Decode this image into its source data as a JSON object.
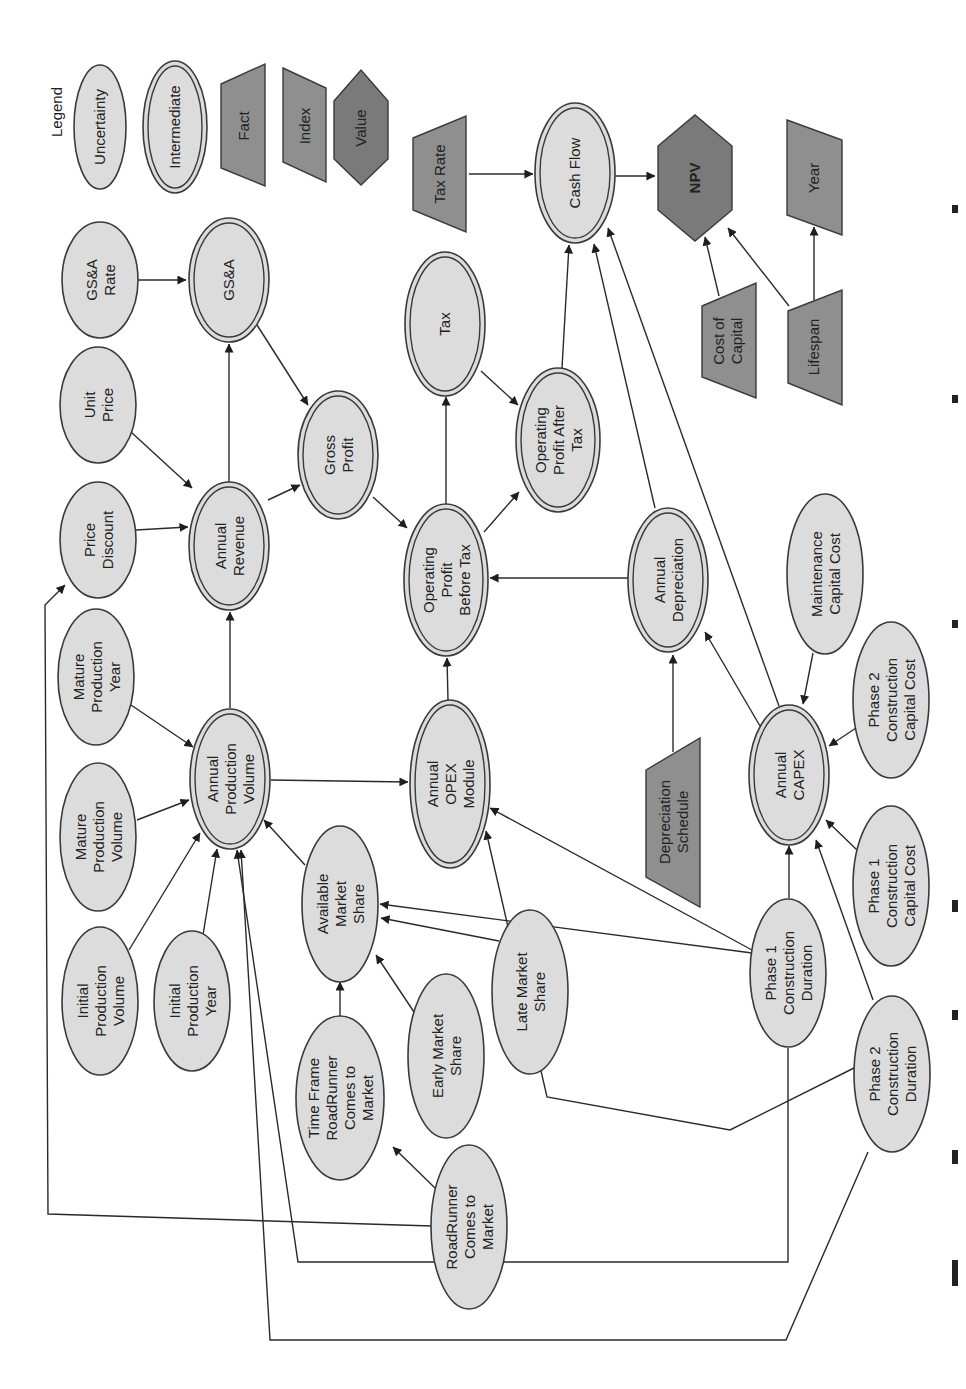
{
  "diagram": {
    "orientation": "rotated -90deg (landscape figure on portrait page)",
    "legend": {
      "title": "Legend",
      "items": [
        {
          "id": "lg-uncertainty",
          "label": "Uncertainty",
          "shape": "ellipse"
        },
        {
          "id": "lg-intermediate",
          "label": "Intermediate",
          "shape": "double-ellipse"
        },
        {
          "id": "lg-fact",
          "label": "Fact",
          "shape": "trapezoid"
        },
        {
          "id": "lg-index",
          "label": "Index",
          "shape": "parallelogram"
        },
        {
          "id": "lg-value",
          "label": "Value",
          "shape": "hexagon"
        }
      ]
    },
    "nodes": [
      {
        "id": "gsa_rate",
        "label": "GS&A\nRate",
        "type": "uncertainty",
        "cx": 100,
        "cy": 280,
        "rx": 38,
        "ry": 58
      },
      {
        "id": "gsa",
        "label": "GS&A",
        "type": "intermediate",
        "cx": 229,
        "cy": 280,
        "rx": 40,
        "ry": 62
      },
      {
        "id": "unit_price",
        "label": "Unit\nPrice",
        "type": "uncertainty",
        "cx": 98,
        "cy": 405,
        "rx": 38,
        "ry": 58
      },
      {
        "id": "price_discount",
        "label": "Price\nDiscount",
        "type": "uncertainty",
        "cx": 98,
        "cy": 540,
        "rx": 38,
        "ry": 58
      },
      {
        "id": "annual_revenue",
        "label": "Annual\nRevenue",
        "type": "intermediate",
        "cx": 229,
        "cy": 546,
        "rx": 40,
        "ry": 64
      },
      {
        "id": "gross_profit",
        "label": "Gross\nProfit",
        "type": "intermediate",
        "cx": 338,
        "cy": 455,
        "rx": 40,
        "ry": 64
      },
      {
        "id": "tax",
        "label": "Tax",
        "type": "intermediate",
        "cx": 445,
        "cy": 324,
        "rx": 40,
        "ry": 72
      },
      {
        "id": "op_before_tax",
        "label": "Operating\nProfit\nBefore Tax",
        "type": "intermediate",
        "cx": 446,
        "cy": 580,
        "rx": 42,
        "ry": 76
      },
      {
        "id": "op_after_tax",
        "label": "Operating\nProfit After\nTax",
        "type": "intermediate",
        "cx": 558,
        "cy": 440,
        "rx": 42,
        "ry": 72
      },
      {
        "id": "cash_flow",
        "label": "Cash Flow",
        "type": "intermediate",
        "cx": 575,
        "cy": 173,
        "rx": 40,
        "ry": 70
      },
      {
        "id": "annual_depreciation",
        "label": "Annual\nDepreciation",
        "type": "intermediate",
        "cx": 668,
        "cy": 580,
        "rx": 40,
        "ry": 72
      },
      {
        "id": "maintenance_capital_cost",
        "label": "Maintenance\nCapital Cost",
        "type": "uncertainty",
        "cx": 825,
        "cy": 574,
        "rx": 38,
        "ry": 80
      },
      {
        "id": "mature_production_year",
        "label": "Mature\nProduction\nYear",
        "type": "uncertainty",
        "cx": 96,
        "cy": 677,
        "rx": 38,
        "ry": 68
      },
      {
        "id": "mature_production_volume",
        "label": "Mature\nProduction\nVolume",
        "type": "uncertainty",
        "cx": 98,
        "cy": 837,
        "rx": 38,
        "ry": 74
      },
      {
        "id": "annual_production_volume",
        "label": "Annual\nProduction\nVolume",
        "type": "intermediate",
        "cx": 230,
        "cy": 779,
        "rx": 40,
        "ry": 70
      },
      {
        "id": "annual_opex_module",
        "label": "Annual\nOPEX\nModule",
        "type": "intermediate",
        "cx": 450,
        "cy": 784,
        "rx": 40,
        "ry": 84
      },
      {
        "id": "depreciation_schedule",
        "label": "Depreciation\nSchedule",
        "type": "fact",
        "cx": 665,
        "cy": 822
      },
      {
        "id": "annual_capex",
        "label": "Annual\nCAPEX",
        "type": "intermediate",
        "cx": 789,
        "cy": 775,
        "rx": 40,
        "ry": 70
      },
      {
        "id": "phase2_capital_cost",
        "label": "Phase 2\nConstruction\nCapital Cost",
        "type": "uncertainty",
        "cx": 891,
        "cy": 700,
        "rx": 38,
        "ry": 78
      },
      {
        "id": "phase1_capital_cost",
        "label": "Phase 1\nConstruction\nCapital Cost",
        "type": "uncertainty",
        "cx": 891,
        "cy": 886,
        "rx": 38,
        "ry": 80
      },
      {
        "id": "available_market_share",
        "label": "Available\nMarket\nShare",
        "type": "uncertainty",
        "cx": 340,
        "cy": 904,
        "rx": 38,
        "ry": 78
      },
      {
        "id": "initial_production_volume",
        "label": "Initial\nProduction\nVolume",
        "type": "uncertainty",
        "cx": 100,
        "cy": 1001,
        "rx": 38,
        "ry": 74
      },
      {
        "id": "initial_production_year",
        "label": "Initial\nProduction\nYear",
        "type": "uncertainty",
        "cx": 192,
        "cy": 1001,
        "rx": 38,
        "ry": 70
      },
      {
        "id": "time_frame_roadrunner",
        "label": "Time Frame\nRoadRunner\nComes to\nMarket",
        "type": "uncertainty",
        "cx": 340,
        "cy": 1098,
        "rx": 44,
        "ry": 82
      },
      {
        "id": "early_market_share",
        "label": "Early Market\nShare",
        "type": "uncertainty",
        "cx": 446,
        "cy": 1056,
        "rx": 38,
        "ry": 82
      },
      {
        "id": "late_market_share",
        "label": "Late Market\nShare",
        "type": "uncertainty",
        "cx": 530,
        "cy": 992,
        "rx": 38,
        "ry": 82
      },
      {
        "id": "roadrunner_comes_to_market",
        "label": "RoadRunner\nComes to\nMarket",
        "type": "uncertainty",
        "cx": 469,
        "cy": 1227,
        "rx": 38,
        "ry": 82
      },
      {
        "id": "phase1_construction_duration",
        "label": "Phase 1\nConstruction\nDuration",
        "type": "uncertainty",
        "cx": 788,
        "cy": 973,
        "rx": 38,
        "ry": 74
      },
      {
        "id": "phase2_construction_duration",
        "label": "Phase 2\nConstruction\nDuration",
        "type": "uncertainty",
        "cx": 892,
        "cy": 1074,
        "rx": 38,
        "ry": 78
      },
      {
        "id": "tax_rate",
        "label": "Tax Rate",
        "type": "fact",
        "cx": 440,
        "cy": 174
      },
      {
        "id": "npv",
        "label": "NPV",
        "type": "value",
        "cx": 695,
        "cy": 178
      },
      {
        "id": "year",
        "label": "Year",
        "type": "index",
        "cx": 814,
        "cy": 178
      },
      {
        "id": "cost_of_capital",
        "label": "Cost of\nCapital",
        "type": "fact",
        "cx": 727,
        "cy": 341
      },
      {
        "id": "lifespan",
        "label": "Lifespan",
        "type": "fact",
        "cx": 814,
        "cy": 345
      }
    ],
    "edges": [
      {
        "from": "gsa_rate",
        "to": "gsa"
      },
      {
        "from": "annual_revenue",
        "to": "gsa"
      },
      {
        "from": "unit_price",
        "to": "annual_revenue"
      },
      {
        "from": "price_discount",
        "to": "annual_revenue"
      },
      {
        "from": "annual_revenue",
        "to": "gross_profit"
      },
      {
        "from": "gsa",
        "to": "gross_profit"
      },
      {
        "from": "gross_profit",
        "to": "op_before_tax"
      },
      {
        "from": "op_before_tax",
        "to": "tax"
      },
      {
        "from": "op_before_tax",
        "to": "op_after_tax"
      },
      {
        "from": "tax",
        "to": "op_after_tax"
      },
      {
        "from": "op_after_tax",
        "to": "cash_flow"
      },
      {
        "from": "annual_depreciation",
        "to": "cash_flow"
      },
      {
        "from": "annual_capex",
        "to": "cash_flow"
      },
      {
        "from": "tax_rate",
        "to": "cash_flow"
      },
      {
        "from": "cash_flow",
        "to": "npv"
      },
      {
        "from": "cost_of_capital",
        "to": "npv"
      },
      {
        "from": "lifespan",
        "to": "npv"
      },
      {
        "from": "lifespan",
        "to": "year"
      },
      {
        "from": "annual_depreciation",
        "to": "op_before_tax"
      },
      {
        "from": "annual_opex_module",
        "to": "op_before_tax"
      },
      {
        "from": "depreciation_schedule",
        "to": "annual_depreciation"
      },
      {
        "from": "annual_capex",
        "to": "annual_depreciation"
      },
      {
        "from": "maintenance_capital_cost",
        "to": "annual_capex"
      },
      {
        "from": "phase2_capital_cost",
        "to": "annual_capex"
      },
      {
        "from": "phase1_capital_cost",
        "to": "annual_capex"
      },
      {
        "from": "phase1_construction_duration",
        "to": "annual_capex"
      },
      {
        "from": "phase2_construction_duration",
        "to": "annual_capex"
      },
      {
        "from": "annual_production_volume",
        "to": "annual_revenue"
      },
      {
        "from": "annual_production_volume",
        "to": "annual_opex_module"
      },
      {
        "from": "mature_production_year",
        "to": "annual_production_volume"
      },
      {
        "from": "mature_production_volume",
        "to": "annual_production_volume"
      },
      {
        "from": "initial_production_volume",
        "to": "annual_production_volume"
      },
      {
        "from": "initial_production_year",
        "to": "annual_production_volume"
      },
      {
        "from": "available_market_share",
        "to": "annual_production_volume"
      },
      {
        "from": "phase1_construction_duration",
        "to": "annual_production_volume"
      },
      {
        "from": "phase2_construction_duration",
        "to": "annual_production_volume"
      },
      {
        "from": "time_frame_roadrunner",
        "to": "available_market_share"
      },
      {
        "from": "early_market_share",
        "to": "available_market_share"
      },
      {
        "from": "late_market_share",
        "to": "available_market_share"
      },
      {
        "from": "phase1_construction_duration",
        "to": "available_market_share"
      },
      {
        "from": "roadrunner_comes_to_market",
        "to": "time_frame_roadrunner"
      },
      {
        "from": "roadrunner_comes_to_market",
        "to": "price_discount"
      },
      {
        "from": "phase1_construction_duration",
        "to": "annual_opex_module"
      },
      {
        "from": "phase2_construction_duration",
        "to": "annual_opex_module"
      }
    ]
  },
  "caption_fragment": "... 7 ... 1 ... 11 ... 1 ... 11 ... 11"
}
